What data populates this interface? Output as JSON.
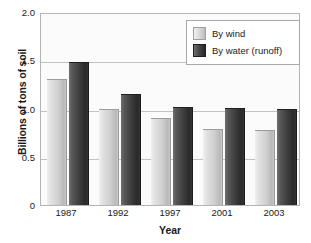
{
  "chart_data": {
    "type": "bar",
    "title": "",
    "xlabel": "Year",
    "ylabel": "Billions of tons of soil",
    "categories": [
      "1987",
      "1992",
      "1997",
      "2001",
      "2003"
    ],
    "series": [
      {
        "name": "By wind",
        "values": [
          1.3,
          0.98,
          0.89,
          0.78,
          0.77
        ],
        "color": "#d0d0d0"
      },
      {
        "name": "By water (runoff)",
        "values": [
          1.47,
          1.14,
          1.01,
          1.0,
          0.98
        ],
        "color": "#3a3a3a"
      }
    ],
    "ylim": [
      0,
      2.0
    ],
    "yticks": [
      "2.0",
      "1.5",
      "1.0",
      "0.5",
      "0"
    ],
    "ytick_values": [
      2.0,
      1.5,
      1.0,
      0.5,
      0
    ],
    "grid": true,
    "legend_position": "top-right"
  },
  "legend": {
    "items": [
      {
        "label": "By wind",
        "swatch": "wind"
      },
      {
        "label": "By water (runoff)",
        "swatch": "water"
      }
    ]
  }
}
